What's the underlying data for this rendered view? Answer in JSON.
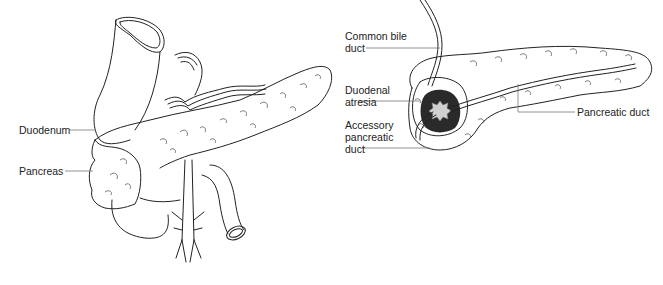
{
  "figure": {
    "panels": [
      {
        "id": "left",
        "description": "Annular pancreas encircling the duodenum, anterior view",
        "labels": [
          {
            "text": "Duodenum"
          },
          {
            "text": "Pancreas"
          }
        ]
      },
      {
        "id": "right",
        "description": "Cross-section showing duodenal atresia with ducts",
        "labels": [
          {
            "line1": "Common bile",
            "line2": "duct"
          },
          {
            "line1": "Duodenal",
            "line2": "atresia"
          },
          {
            "line1": "Accessory",
            "line2": "pancreatic",
            "line3": "duct"
          },
          {
            "text": "Pancreatic duct"
          }
        ]
      }
    ]
  }
}
